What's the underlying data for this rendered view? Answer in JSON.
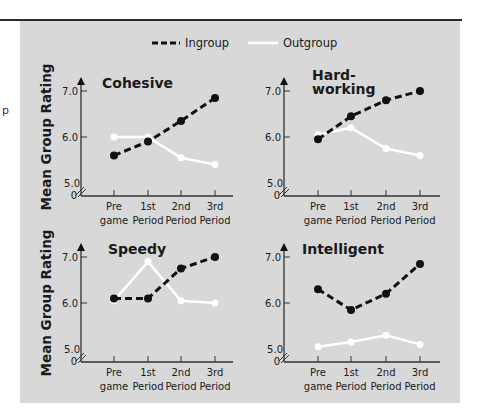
{
  "chart_data": {
    "type": "line",
    "legend": {
      "position": "top-center",
      "entries": [
        {
          "name": "Ingroup",
          "style": "dashed-black",
          "color": "#111111"
        },
        {
          "name": "Outgroup",
          "style": "solid-white",
          "color": "#ffffff"
        }
      ]
    },
    "ylabel": "Mean Group Rating",
    "xlabel": "",
    "categories": [
      "Pre game",
      "1st Period",
      "2nd Period",
      "3rd Period"
    ],
    "category_lines": [
      [
        "Pre",
        "game"
      ],
      [
        "1st",
        "Period"
      ],
      [
        "2nd",
        "Period"
      ],
      [
        "3rd",
        "Period"
      ]
    ],
    "yticks": [
      "5.0",
      "6.0",
      "7.0"
    ],
    "origin_label": "0",
    "ylim": [
      5.0,
      7.0
    ],
    "axis_break": true,
    "grid": false,
    "panels": [
      {
        "title_lines": [
          "Cohesive"
        ],
        "series": [
          {
            "name": "Ingroup",
            "values": [
              5.6,
              5.9,
              6.35,
              6.85
            ]
          },
          {
            "name": "Outgroup",
            "values": [
              6.0,
              6.0,
              5.55,
              5.4
            ]
          }
        ]
      },
      {
        "title_lines": [
          "Hard-",
          "working"
        ],
        "series": [
          {
            "name": "Ingroup",
            "values": [
              5.95,
              6.45,
              6.8,
              7.0
            ]
          },
          {
            "name": "Outgroup",
            "values": [
              6.05,
              6.2,
              5.75,
              5.6
            ]
          }
        ]
      },
      {
        "title_lines": [
          "Speedy"
        ],
        "series": [
          {
            "name": "Ingroup",
            "values": [
              6.1,
              6.1,
              6.75,
              7.0
            ]
          },
          {
            "name": "Outgroup",
            "values": [
              6.05,
              6.9,
              6.05,
              6.0
            ]
          }
        ]
      },
      {
        "title_lines": [
          "Intelligent"
        ],
        "series": [
          {
            "name": "Ingroup",
            "values": [
              6.3,
              5.85,
              6.2,
              6.85
            ]
          },
          {
            "name": "Outgroup",
            "values": [
              5.05,
              5.15,
              5.3,
              5.1
            ]
          }
        ]
      }
    ]
  },
  "colors": {
    "panel_bg": "#d8d8d8",
    "ingroup": "#111111",
    "outgroup": "#ffffff",
    "axis": "#333333"
  },
  "margin_fragment": "p"
}
